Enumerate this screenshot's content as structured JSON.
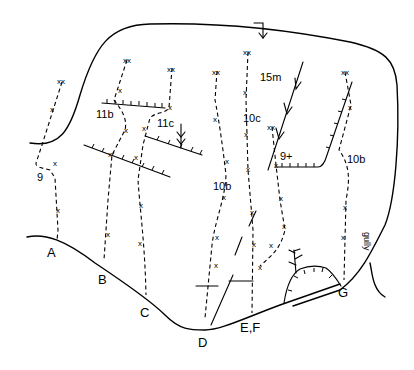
{
  "diagram": {
    "type": "climbing-topo",
    "colors": {
      "ink": "#000000",
      "background": "#ffffff"
    },
    "start_labels": [
      {
        "id": "A",
        "label": "A",
        "x": 47,
        "y": 257
      },
      {
        "id": "B",
        "label": "B",
        "x": 98,
        "y": 284
      },
      {
        "id": "C",
        "label": "C",
        "x": 140,
        "y": 317
      },
      {
        "id": "D",
        "label": "D",
        "x": 198,
        "y": 347
      },
      {
        "id": "EF",
        "label": "E,F",
        "x": 240,
        "y": 332
      },
      {
        "id": "G",
        "label": "G",
        "x": 338,
        "y": 297
      }
    ],
    "grades": [
      {
        "route": "A",
        "label": "9",
        "x": 37,
        "y": 181
      },
      {
        "route": "B",
        "label": "11b",
        "x": 96,
        "y": 118
      },
      {
        "route": "C",
        "label": "11c",
        "x": 157,
        "y": 127
      },
      {
        "route": "D",
        "label": "10b",
        "x": 213,
        "y": 190
      },
      {
        "route": "E",
        "label": "10c",
        "x": 243,
        "y": 122
      },
      {
        "route": "F",
        "label": "9+",
        "x": 280,
        "y": 160
      },
      {
        "route": "G",
        "label": "10b",
        "x": 347,
        "y": 163
      }
    ],
    "annotations": {
      "rappel": "15m",
      "gully": "gully",
      "bolt_mark": "x",
      "anchor_mark": "xx"
    }
  }
}
